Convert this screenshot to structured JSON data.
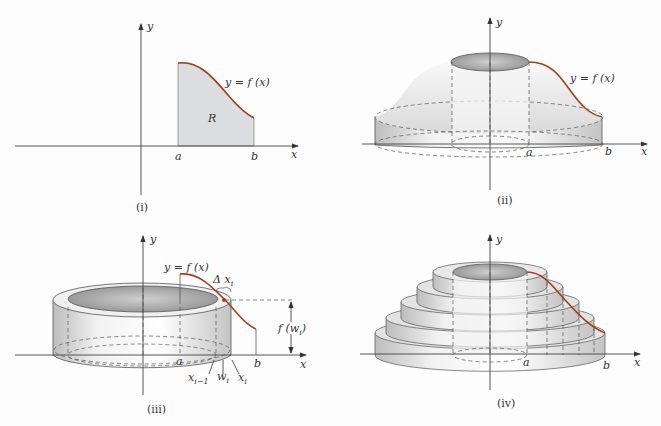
{
  "figure": {
    "colors": {
      "curve": "#a0401e",
      "region_fill": "#dcdde0",
      "solid_fill": "#e6e6e6",
      "axis": "#444444"
    },
    "panels": [
      {
        "id": "i",
        "caption": "(i)",
        "axis_y": "y",
        "axis_x": "x",
        "curve_label": "y = f (x)",
        "region_label": "R",
        "a": "a",
        "b": "b"
      },
      {
        "id": "ii",
        "caption": "(ii)",
        "axis_y": "y",
        "axis_x": "x",
        "curve_label": "y = f (x)",
        "a": "a",
        "b": "b"
      },
      {
        "id": "iii",
        "caption": "(iii)",
        "axis_y": "y",
        "axis_x": "x",
        "curve_label": "y = f (x)",
        "a": "a",
        "b": "b",
        "delta_label": "Δ x",
        "delta_sub": "i",
        "height_label": "f (w",
        "height_sub": "i",
        "height_close": ")",
        "x_prev": "x",
        "x_prev_sub": "i−1",
        "w": "w",
        "w_sub": "i",
        "x_i": "x",
        "x_i_sub": "i"
      },
      {
        "id": "iv",
        "caption": "(iv)",
        "axis_y": "y",
        "axis_x": "x",
        "a": "a",
        "b": "b"
      }
    ]
  }
}
